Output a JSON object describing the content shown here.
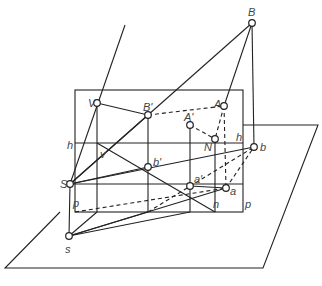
{
  "diagram": {
    "type": "perspective-projection",
    "labels": {
      "B": "B",
      "A": "A",
      "N": "N",
      "V": "V",
      "B_prime": "B'",
      "A_prime": "A'",
      "h_left": "h",
      "h_right": "h",
      "v": "v",
      "b_prime": "b'",
      "b": "b",
      "S": "S",
      "a_prime": "a'",
      "a": "a",
      "p_left": "p",
      "n": "n",
      "p_right": "p",
      "s": "s"
    },
    "colors": {
      "line": "#222222",
      "label": "#444444",
      "background": "#ffffff"
    }
  }
}
